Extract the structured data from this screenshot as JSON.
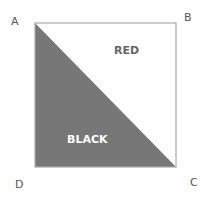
{
  "corners": {
    "a": "A",
    "b": "B",
    "c": "C",
    "d": "D"
  },
  "regions": {
    "upper": {
      "label": "RED",
      "fill": "#ffffff",
      "text_color": "#666666"
    },
    "lower": {
      "label": "BLACK",
      "fill": "#777777",
      "text_color": "#ffffff"
    }
  },
  "colors": {
    "outline": "#aaaaaa"
  }
}
